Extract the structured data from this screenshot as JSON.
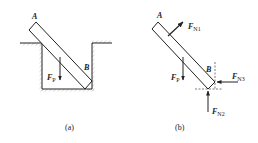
{
  "figure_a": {
    "caption": "(a)",
    "point_a": "A",
    "point_b": "B",
    "force_weight": {
      "main": "F",
      "sub": "P"
    }
  },
  "figure_b": {
    "caption": "(b)",
    "point_a": "A",
    "point_b": "B",
    "force_weight": {
      "main": "F",
      "sub": "P"
    },
    "force_n1": {
      "main": "F",
      "sub": "N1"
    },
    "force_n2": {
      "main": "F",
      "sub": "N2"
    },
    "force_n3": {
      "main": "F",
      "sub": "N3"
    }
  },
  "colors": {
    "stroke": "#222222",
    "hatch": "#888888",
    "background": "#ffffff"
  }
}
